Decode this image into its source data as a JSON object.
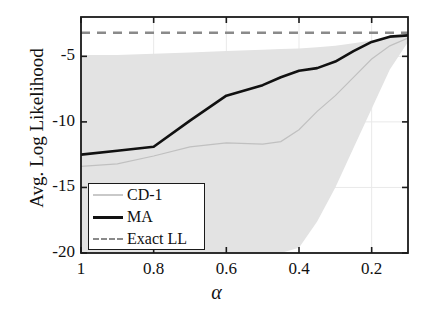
{
  "chart_data": {
    "type": "line",
    "title": "",
    "xlabel": "α",
    "ylabel": "Avg. Log Likelihood",
    "xlim": [
      1.0,
      0.1
    ],
    "ylim": [
      -20,
      -2
    ],
    "x_reversed": true,
    "grid": true,
    "xticks": [
      1,
      0.8,
      0.6,
      0.4,
      0.2
    ],
    "xticklabels": [
      "1",
      "0.8",
      "0.6",
      "0.4",
      "0.2"
    ],
    "yticks": [
      -5,
      -10,
      -15,
      -20
    ],
    "yticklabels": [
      "-5",
      "-10",
      "-15",
      "-20"
    ],
    "legend_position": "lower left",
    "series": [
      {
        "name": "CD-1",
        "style": "solid",
        "color": "#c0c0c0",
        "linewidth": 1.2,
        "x": [
          1.0,
          0.9,
          0.8,
          0.7,
          0.6,
          0.5,
          0.45,
          0.4,
          0.35,
          0.3,
          0.25,
          0.2,
          0.15,
          0.1
        ],
        "y": [
          -13.4,
          -13.2,
          -12.6,
          -11.9,
          -11.6,
          -11.7,
          -11.5,
          -10.6,
          -9.2,
          -8.0,
          -6.6,
          -5.2,
          -4.2,
          -3.6
        ]
      },
      {
        "name": "MA",
        "style": "solid",
        "color": "#111111",
        "linewidth": 2.6,
        "x": [
          1.0,
          0.9,
          0.8,
          0.7,
          0.6,
          0.5,
          0.45,
          0.4,
          0.35,
          0.3,
          0.25,
          0.2,
          0.15,
          0.1
        ],
        "y": [
          -12.5,
          -12.2,
          -11.9,
          -9.9,
          -8.0,
          -7.2,
          -6.6,
          -6.1,
          -5.9,
          -5.4,
          -4.6,
          -3.9,
          -3.5,
          -3.4
        ]
      },
      {
        "name": "Exact LL",
        "style": "dashed",
        "color": "#8a8a8a",
        "linewidth": 2.4,
        "constant_y": -3.2
      }
    ],
    "shaded_band": {
      "label": "CD-1 std. dev. band",
      "color": "#e2e2e2",
      "x": [
        1.0,
        0.9,
        0.8,
        0.7,
        0.6,
        0.5,
        0.45,
        0.4,
        0.35,
        0.3,
        0.25,
        0.2,
        0.15,
        0.1
      ],
      "upper": [
        -4.9,
        -4.9,
        -4.8,
        -4.7,
        -4.6,
        -4.5,
        -4.45,
        -4.4,
        -4.3,
        -4.2,
        -4.0,
        -3.8,
        -3.6,
        -3.4
      ],
      "lower": [
        -20.0,
        -20.0,
        -20.0,
        -20.0,
        -20.0,
        -20.0,
        -20.0,
        -19.6,
        -17.6,
        -15.0,
        -12.0,
        -9.0,
        -6.0,
        -3.9
      ]
    },
    "legend_entries": [
      {
        "label": "CD-1",
        "style": "solid-faint"
      },
      {
        "label": "MA",
        "style": "solid-bold"
      },
      {
        "label": "Exact LL",
        "style": "dashed"
      }
    ]
  }
}
